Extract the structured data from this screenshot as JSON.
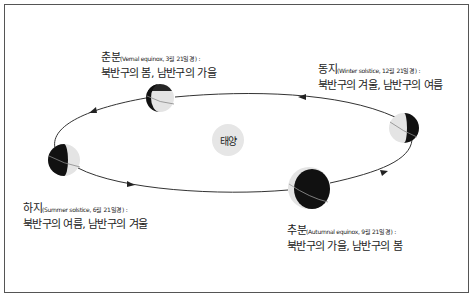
{
  "diagram": {
    "title": "",
    "sun": {
      "label": "태양",
      "color": "#e6e6e6"
    },
    "orbit_direction": "counter-clockwise (as viewed)",
    "seasons": [
      {
        "id": "vernal",
        "name": "춘분",
        "english": "(Vernal equinox, 3월 21일경) :",
        "description": "북반구의 봄, 남반구의 가을"
      },
      {
        "id": "winter",
        "name": "동지",
        "english": "(Winter solstice, 12월 21일경) :",
        "description": "북반구의 겨울, 남반구의 여름"
      },
      {
        "id": "summer",
        "name": "하지",
        "english": "(Summer solstice, 6월 21일경) :",
        "description": "북반구의 여름, 남반구의 겨울"
      },
      {
        "id": "autumnal",
        "name": "추분",
        "english": "(Autumnal equinox, 9월 21일경) :",
        "description": "북반구의 가을, 남반구의 봄"
      }
    ],
    "colors": {
      "night_side": "#111111",
      "day_side": "#e4e4e4",
      "orbit": "#333333",
      "border": "#555555"
    }
  }
}
